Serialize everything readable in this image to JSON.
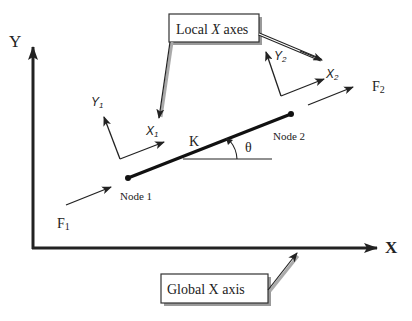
{
  "diagram": {
    "global_axes": {
      "y_label": "Y",
      "x_label": "X"
    },
    "callouts": {
      "local": {
        "prefix": "Local ",
        "italic": "X",
        "suffix": " axes"
      },
      "global": "Global X axis"
    },
    "local_frame_1": {
      "y_label": "Y",
      "y_sub": "1",
      "x_label": "X",
      "x_sub": "1"
    },
    "local_frame_2": {
      "y_label": "Y",
      "y_sub": "2",
      "x_label": "X",
      "x_sub": "2"
    },
    "element": {
      "stiffness_label": "K",
      "angle_label": "θ",
      "node_1_label": "Node 1",
      "node_2_label": "Node 2"
    },
    "forces": {
      "f1": {
        "label": "F",
        "sub": "1"
      },
      "f2": {
        "label": "F",
        "sub": "2"
      }
    }
  }
}
